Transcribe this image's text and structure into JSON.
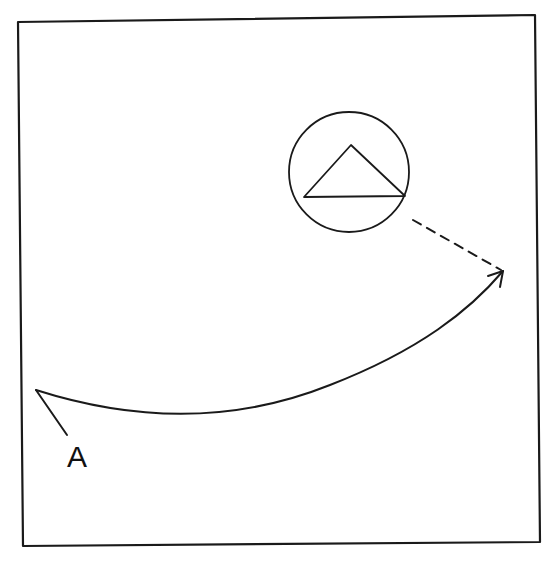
{
  "diagram": {
    "type": "hand-drawn sketch",
    "background": "#ffffff",
    "ink_color": "#1a1a1a",
    "frame": {
      "shape": "rectangle",
      "corners": {
        "top_left": [
          18,
          22
        ],
        "top_right": [
          535,
          15
        ],
        "bottom_right": [
          540,
          542
        ],
        "bottom_left": [
          23,
          546
        ]
      }
    },
    "circle": {
      "cx": 349,
      "cy": 172,
      "r": 60
    },
    "triangle": {
      "points": [
        [
          304,
          197
        ],
        [
          351,
          145
        ],
        [
          405,
          196
        ]
      ]
    },
    "solid_arrow": {
      "start": [
        36,
        390
      ],
      "end": [
        503,
        271
      ],
      "style": "solid curve with open arrowhead"
    },
    "dashed_line": {
      "from": [
        413,
        220
      ],
      "to": [
        503,
        271
      ],
      "style": "dashed"
    },
    "label_pointer": {
      "from": [
        36,
        390
      ],
      "to": [
        67,
        435
      ]
    },
    "labels": [
      {
        "id": "A",
        "text": "A",
        "x": 67,
        "y": 467
      }
    ]
  }
}
